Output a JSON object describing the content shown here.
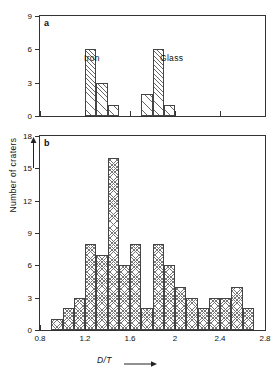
{
  "chart_data": [
    {
      "type": "bar",
      "panel": "a",
      "title": "",
      "xlabel": "D/T",
      "ylabel": "Number of craters",
      "xlim": [
        0.8,
        2.8
      ],
      "ylim": [
        0,
        9
      ],
      "yticks": [
        0,
        3,
        6,
        9
      ],
      "xticks": [
        0.8,
        1.2,
        1.6,
        2.0,
        2.4,
        2.8
      ],
      "bin_width": 0.1,
      "grid": false,
      "legend_position": "inline-annotation",
      "series": [
        {
          "name": "Iron",
          "bins": [
            1.2,
            1.3,
            1.4
          ],
          "values": [
            6,
            3,
            1
          ]
        },
        {
          "name": "Glass",
          "bins": [
            1.7,
            1.8,
            1.9
          ],
          "values": [
            2,
            6,
            1
          ]
        }
      ]
    },
    {
      "type": "bar",
      "panel": "b",
      "title": "",
      "xlabel": "D/T",
      "ylabel": "Number of craters",
      "xlim": [
        0.8,
        2.8
      ],
      "ylim": [
        0,
        18
      ],
      "yticks": [
        0,
        3,
        6,
        9,
        12,
        15,
        18
      ],
      "xticks": [
        0.8,
        1.2,
        1.6,
        2.0,
        2.4,
        2.8
      ],
      "bin_width": 0.1,
      "grid": false,
      "bins": [
        0.9,
        1.0,
        1.1,
        1.2,
        1.3,
        1.4,
        1.5,
        1.6,
        1.7,
        1.8,
        1.9,
        2.0,
        2.1,
        2.2,
        2.3,
        2.4,
        2.5,
        2.6
      ],
      "values": [
        1,
        2,
        3,
        8,
        7,
        16,
        6,
        8,
        2,
        8,
        6,
        4,
        3,
        2,
        3,
        3,
        4,
        2
      ]
    }
  ],
  "panels": {
    "a": {
      "tag": "a"
    },
    "b": {
      "tag": "b"
    }
  },
  "axes": {
    "x_title": "D/T",
    "y_title": "Number of craters",
    "panel_a_yticks": [
      "0",
      "3",
      "6",
      "9"
    ],
    "panel_b_yticks": [
      "0",
      "3",
      "6",
      "9",
      "12",
      "15",
      "18"
    ],
    "xticks": [
      "0.8",
      "1.2",
      "1.6",
      "2.0",
      "2.4",
      "2.8"
    ]
  },
  "annotations": {
    "iron": "Iron",
    "glass": "Glass"
  },
  "colors": {
    "axis": "#333333",
    "hatch": "#6f6f6f",
    "background": "#ffffff",
    "text": "#111111"
  }
}
